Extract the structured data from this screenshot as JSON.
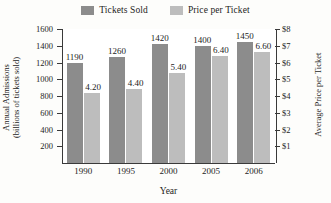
{
  "chart_data": {
    "type": "bar",
    "title": "",
    "categories": [
      "1990",
      "1995",
      "2000",
      "2005",
      "2006"
    ],
    "xlabel": "Year",
    "grid": false,
    "legend_position": "top-center",
    "series": [
      {
        "name": "Tickets Sold",
        "axis": "left",
        "color": "#8c8c8c",
        "values": [
          1190,
          1260,
          1420,
          1400,
          1450
        ],
        "labels": [
          "1190",
          "1260",
          "1420",
          "1400",
          "1450"
        ]
      },
      {
        "name": "Price per Ticket",
        "axis": "right",
        "color": "#bdbdbd",
        "values": [
          4.2,
          4.4,
          5.4,
          6.4,
          6.6
        ],
        "labels": [
          "4.20",
          "4.40",
          "5.40",
          "6.40",
          "6.60"
        ]
      }
    ],
    "left_axis": {
      "title_line1": "Annual Admissions",
      "title_line2": "(billions of tickets sold)",
      "ticks": [
        200,
        400,
        600,
        800,
        1000,
        1200,
        1400,
        1600
      ],
      "tick_labels": [
        "200",
        "400",
        "600",
        "800",
        "1000",
        "1200",
        "1400",
        "1600"
      ],
      "min": 0,
      "max": 1600
    },
    "right_axis": {
      "title": "Average Price per Ticket",
      "ticks": [
        1,
        2,
        3,
        4,
        5,
        6,
        7,
        8
      ],
      "tick_labels": [
        "$1",
        "$2",
        "$3",
        "$4",
        "$5",
        "$6",
        "$7",
        "$8"
      ],
      "min": 0,
      "max": 8
    }
  },
  "legend": {
    "items": [
      {
        "label": "Tickets Sold",
        "color": "#8c8c8c"
      },
      {
        "label": "Price per Ticket",
        "color": "#bdbdbd"
      }
    ]
  }
}
